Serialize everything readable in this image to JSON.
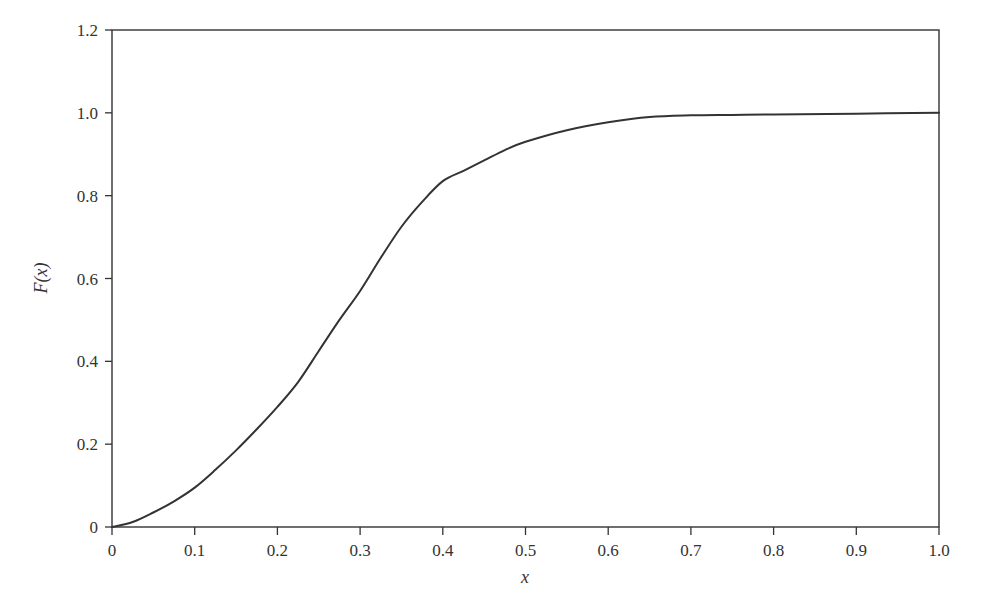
{
  "chart_data": {
    "type": "line",
    "title": "",
    "xlabel": "x",
    "ylabel": "F(x)",
    "xlim": [
      0,
      1.0
    ],
    "ylim": [
      0,
      1.2
    ],
    "grid": false,
    "legend": null,
    "x_ticks": [
      "0",
      "0.1",
      "0.2",
      "0.3",
      "0.4",
      "0.5",
      "0.6",
      "0.7",
      "0.8",
      "0.9",
      "1.0"
    ],
    "y_ticks": [
      "0",
      "0.2",
      "0.4",
      "0.6",
      "0.8",
      "1.0",
      "1.2"
    ],
    "series": [
      {
        "name": "F(x)",
        "color": "#333333",
        "x": [
          0,
          0.025,
          0.05,
          0.075,
          0.1,
          0.125,
          0.15,
          0.175,
          0.2,
          0.225,
          0.25,
          0.275,
          0.3,
          0.325,
          0.35,
          0.375,
          0.4,
          0.425,
          0.45,
          0.475,
          0.5,
          0.55,
          0.6,
          0.65,
          0.7,
          0.75,
          0.8,
          0.9,
          1.0
        ],
        "values": [
          0,
          0.012,
          0.035,
          0.062,
          0.095,
          0.138,
          0.185,
          0.236,
          0.29,
          0.35,
          0.425,
          0.5,
          0.57,
          0.65,
          0.725,
          0.785,
          0.835,
          0.86,
          0.885,
          0.91,
          0.93,
          0.958,
          0.977,
          0.99,
          0.994,
          0.995,
          0.996,
          0.998,
          1.0
        ]
      }
    ]
  },
  "axes": {
    "xlabel": "x",
    "ylabel": "F(x)"
  }
}
